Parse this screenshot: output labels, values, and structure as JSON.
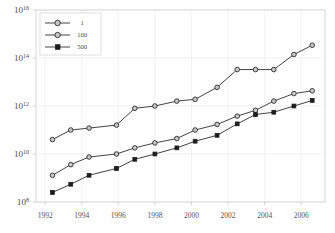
{
  "chart_data": {
    "type": "line",
    "title": "",
    "xlabel": "",
    "ylabel": "",
    "scale": "semilog-y",
    "grid": true,
    "legend_position": "top-left",
    "xlim": [
      1991.5,
      2007.3
    ],
    "ylim": [
      100000000.0,
      1e+16
    ],
    "xticks": [
      1992,
      1994,
      1996,
      1998,
      2000,
      2002,
      2004,
      2006
    ],
    "xtick_labels": [
      "1992",
      "1994",
      "1996",
      "1998",
      "2000",
      "2002",
      "2004",
      "2006"
    ],
    "yticks": [
      100000000.0,
      10000000000.0,
      1000000000000.0,
      100000000000000.0,
      1e+16
    ],
    "ytick_labels": [
      "10^8",
      "10^10",
      "10^12",
      "10^14",
      "10^16"
    ],
    "ytick_mantissa": [
      "10",
      "10",
      "10",
      "10",
      "10"
    ],
    "ytick_exponent": [
      "8",
      "10",
      "12",
      "14",
      "16"
    ],
    "x": [
      1992.4,
      1993.4,
      1994.4,
      1995.9,
      1996.9,
      1998.0,
      1999.2,
      2000.2,
      2001.4,
      2002.5,
      2003.5,
      2004.5,
      2005.6,
      2006.6
    ],
    "series": [
      {
        "name": "1",
        "marker": "circle-open",
        "values": [
          40000000000.0,
          100000000000.0,
          120000000000.0,
          160000000000.0,
          800000000000.0,
          1000000000000.0,
          1600000000000.0,
          1900000000000.0,
          6000000000000.0,
          33000000000000.0,
          33000000000000.0,
          33000000000000.0,
          140000000000000.0,
          340000000000000.0
        ]
      },
      {
        "name": "100",
        "marker": "circle-open",
        "values": [
          1300000000.0,
          3600000000.0,
          7500000000.0,
          10000000000.0,
          18000000000.0,
          29000000000.0,
          44000000000.0,
          100000000000.0,
          170000000000.0,
          380000000000.0,
          660000000000.0,
          1600000000000.0,
          3300000000000.0,
          4300000000000.0
        ]
      },
      {
        "name": "500",
        "marker": "square-filled",
        "values": [
          250000000.0,
          550000000.0,
          1300000000.0,
          2500000000.0,
          6000000000.0,
          10000000000.0,
          18000000000.0,
          34000000000.0,
          60000000000.0,
          180000000000.0,
          440000000000.0,
          550000000000.0,
          1000000000000.0,
          1700000000000.0
        ]
      }
    ]
  },
  "legend": {
    "items": [
      {
        "label": "1"
      },
      {
        "label": "100"
      },
      {
        "label": "500"
      }
    ]
  },
  "colors": {
    "line": "#2f2f2f",
    "marker_open_fill": "#c8c8c8",
    "marker_fill": "#1d1d1d",
    "frame": "#d8d8d8",
    "grid": "#eeeeee",
    "background": "#fefefe"
  }
}
